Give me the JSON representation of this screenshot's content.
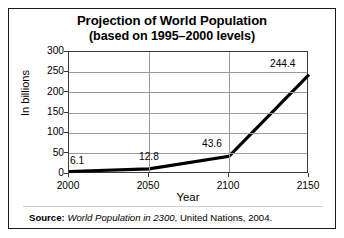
{
  "figure": {
    "title_line1": "Projection of World Population",
    "title_line2": "(based on 1995–2000 levels)",
    "source": {
      "label": "Source:",
      "work": "World Population in 2300",
      "rest": ", United Nations, 2004."
    }
  },
  "chart_data": {
    "type": "line",
    "title": "Projection of World Population (based on 1995–2000 levels)",
    "xlabel": "Year",
    "ylabel": "In billions",
    "x": [
      2000,
      2050,
      2100,
      2150
    ],
    "values": [
      6.1,
      12.8,
      43.6,
      244.4
    ],
    "point_labels": [
      "6.1",
      "12.8",
      "43.6",
      "244.4"
    ],
    "xticks": [
      "2000",
      "2050",
      "2100",
      "2150"
    ],
    "yticks": [
      "0",
      "50",
      "100",
      "150",
      "200",
      "250",
      "300"
    ],
    "xlim": [
      2000,
      2150
    ],
    "ylim": [
      0,
      300
    ],
    "grid": "both",
    "legend": "none",
    "series_color": "#000000"
  }
}
